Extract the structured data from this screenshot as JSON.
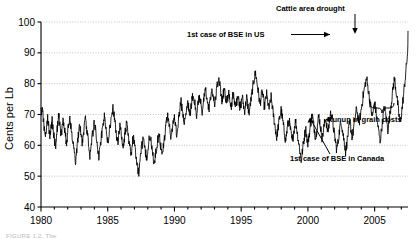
{
  "chart_data": {
    "type": "line",
    "title": "",
    "xlabel": "",
    "ylabel": "Cents per Lb",
    "xlim": [
      1980,
      2007.5
    ],
    "ylim": [
      40,
      100
    ],
    "yticks": [
      40,
      50,
      60,
      70,
      80,
      90,
      100
    ],
    "xticks": [
      1980,
      1985,
      1990,
      1995,
      2000,
      2005
    ],
    "xtick_labels": [
      "1980",
      "1985",
      "1990",
      "1995",
      "2000",
      "2005"
    ],
    "ytick_labels": [
      "40",
      "50",
      "60",
      "70",
      "80",
      "90",
      "100"
    ],
    "x_minor_tick_step": 1,
    "grid": "horizontal-dotted",
    "legend": "none",
    "line_color": "#000000",
    "series": [
      {
        "name": "Cattle price",
        "units": "cents per pound",
        "frequency": "monthly",
        "x_start": 1980.0,
        "x_step": 0.0833,
        "values": [
          70.5,
          72.0,
          69.0,
          65.5,
          63.0,
          66.5,
          68.5,
          66.0,
          63.5,
          66.0,
          68.0,
          65.0,
          62.0,
          59.5,
          63.0,
          67.0,
          69.5,
          66.5,
          63.5,
          65.5,
          68.0,
          66.0,
          63.0,
          61.0,
          64.0,
          67.5,
          69.0,
          66.0,
          63.0,
          60.5,
          58.0,
          55.0,
          57.5,
          61.0,
          64.5,
          66.0,
          63.5,
          61.0,
          63.5,
          66.5,
          68.5,
          66.0,
          63.0,
          60.0,
          57.0,
          59.5,
          62.5,
          65.0,
          67.5,
          65.0,
          62.0,
          59.0,
          56.5,
          59.0,
          62.0,
          64.5,
          67.0,
          69.0,
          66.5,
          63.5,
          61.0,
          63.0,
          65.5,
          68.0,
          70.5,
          72.0,
          69.0,
          66.0,
          63.0,
          61.0,
          63.5,
          66.0,
          64.0,
          61.5,
          59.0,
          62.0,
          65.0,
          67.0,
          64.5,
          62.0,
          59.5,
          57.0,
          60.0,
          62.5,
          60.0,
          57.5,
          55.0,
          52.5,
          51.0,
          54.0,
          57.5,
          60.5,
          62.5,
          60.0,
          57.5,
          55.5,
          58.0,
          61.0,
          63.5,
          61.0,
          58.5,
          56.0,
          54.0,
          56.5,
          59.5,
          62.0,
          64.0,
          61.5,
          59.0,
          57.0,
          59.5,
          62.5,
          65.0,
          67.5,
          69.5,
          67.0,
          64.5,
          62.5,
          65.0,
          67.5,
          69.0,
          66.5,
          64.0,
          66.5,
          69.5,
          72.0,
          74.0,
          71.5,
          69.0,
          67.0,
          69.5,
          72.5,
          74.5,
          72.0,
          70.0,
          72.5,
          75.0,
          77.0,
          74.5,
          72.0,
          70.0,
          72.5,
          74.5,
          76.0,
          73.5,
          71.0,
          73.5,
          76.0,
          78.0,
          75.5,
          73.0,
          71.5,
          74.0,
          76.5,
          78.0,
          75.5,
          73.0,
          75.5,
          78.0,
          80.0,
          81.5,
          79.0,
          76.5,
          74.5,
          76.5,
          78.5,
          76.0,
          73.5,
          75.5,
          77.5,
          75.0,
          72.5,
          74.5,
          77.0,
          74.5,
          72.0,
          74.0,
          76.5,
          74.0,
          71.5,
          73.5,
          76.0,
          73.5,
          71.0,
          73.0,
          75.5,
          73.0,
          70.5,
          72.5,
          75.0,
          77.5,
          80.0,
          82.0,
          83.5,
          81.0,
          78.5,
          76.0,
          73.5,
          75.5,
          77.5,
          75.0,
          72.5,
          74.5,
          76.5,
          74.0,
          71.5,
          73.5,
          75.5,
          73.0,
          70.0,
          67.5,
          65.0,
          62.5,
          65.0,
          67.5,
          69.5,
          71.5,
          69.0,
          66.5,
          64.0,
          61.5,
          64.0,
          66.5,
          68.5,
          66.0,
          63.5,
          61.0,
          63.5,
          66.0,
          68.0,
          65.5,
          63.0,
          60.5,
          58.0,
          55.0,
          57.5,
          60.5,
          63.0,
          65.5,
          63.0,
          60.5,
          63.0,
          65.5,
          68.0,
          70.0,
          67.5,
          65.0,
          62.5,
          65.0,
          67.5,
          69.5,
          67.0,
          64.5,
          62.0,
          64.5,
          67.0,
          69.0,
          66.5,
          64.0,
          66.5,
          69.0,
          71.0,
          68.5,
          66.0,
          63.5,
          61.0,
          58.5,
          60.5,
          63.5,
          66.0,
          68.0,
          65.5,
          63.0,
          60.5,
          58.0,
          60.5,
          63.0,
          65.5,
          67.5,
          65.0,
          62.5,
          65.0,
          67.5,
          70.0,
          72.0,
          69.5,
          67.0,
          69.0,
          71.5,
          74.0,
          76.5,
          78.5,
          80.5,
          81.5,
          79.0,
          76.5,
          74.0,
          71.5,
          69.0,
          71.5,
          74.0,
          71.5,
          69.0,
          66.5,
          64.0,
          61.5,
          64.0,
          67.0,
          70.0,
          72.5,
          70.0,
          67.5,
          65.0,
          67.5,
          70.5,
          73.5,
          76.5,
          79.5,
          81.5,
          79.0,
          76.0,
          73.0,
          70.0,
          67.0,
          69.5,
          72.5,
          76.0,
          79.5,
          83.0,
          87.0,
          91.0,
          95.0,
          98.0,
          92.0,
          86.0,
          81.0,
          76.5,
          72.0,
          74.5,
          78.0,
          81.5,
          84.0,
          81.0,
          78.0,
          80.5,
          83.5,
          86.5,
          89.0,
          86.5,
          84.0,
          86.5,
          89.0,
          87.0,
          84.5,
          86.5,
          89.0,
          86.5,
          84.0,
          86.0,
          88.5,
          86.0,
          83.5,
          85.5,
          88.0,
          90.5,
          93.0,
          95.5,
          97.0,
          94.0,
          90.0,
          86.0,
          82.0,
          78.0,
          74.0,
          72.5,
          74.5,
          77.5,
          80.5,
          83.5,
          86.5,
          84.0,
          81.5,
          84.0,
          87.0,
          90.0,
          87.5,
          85.0,
          87.5,
          90.5,
          93.5,
          96.0,
          97.0
        ]
      }
    ],
    "annotations": [
      {
        "id": "bse-us",
        "text": "1st case of BSE in US",
        "x": 2003.9,
        "y": 97.5,
        "marker": "horizontal-arrow-right"
      },
      {
        "id": "drought",
        "text": "Cattle area drought",
        "x": 2006.0,
        "y": 96.0,
        "marker": "vertical-arrow-down"
      },
      {
        "id": "grain-costs",
        "text": "Runup in grain costs",
        "x": 2006.9,
        "y": 72.0,
        "marker": "curly-brace-below"
      },
      {
        "id": "bse-canada",
        "text": "1st case of BSE in Canada",
        "x": 2003.1,
        "y": 70.5,
        "marker": "diagonal-leader-line"
      }
    ]
  },
  "figure": {
    "caption": "FIGURE 1.2. The"
  }
}
